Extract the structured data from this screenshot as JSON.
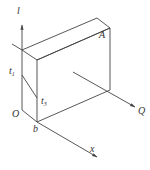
{
  "diagram": {
    "type": "isometric-box-with-axes",
    "colors": {
      "line": "#444444",
      "text": "#333333",
      "background": "#ffffff"
    },
    "labels": {
      "l": "l",
      "A": "A",
      "t1": "t",
      "t1_sub": "1",
      "t3": "t",
      "t3_sub": "3",
      "O": "O",
      "b": "b",
      "Q": "Q",
      "x": "x"
    }
  }
}
